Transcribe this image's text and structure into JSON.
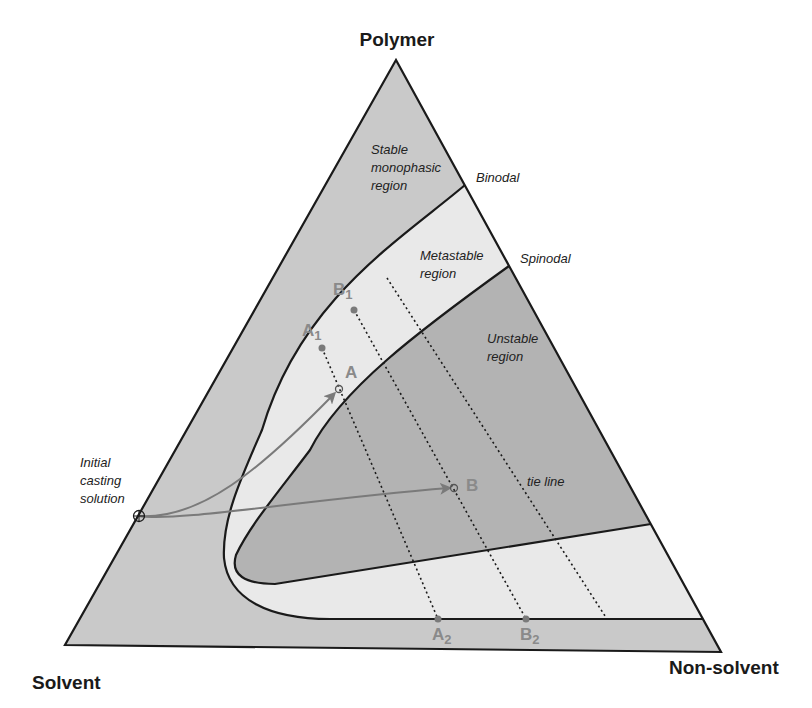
{
  "diagram": {
    "type": "ternary-phase-diagram",
    "vertices": {
      "top": "Polymer",
      "bottom_left": "Solvent",
      "bottom_right": "Non-solvent"
    },
    "curves": {
      "binodal": "Binodal",
      "spinodal": "Spinodal"
    },
    "regions": {
      "stable": [
        "Stable",
        "monophasic",
        "region"
      ],
      "metastable": [
        "Metastable",
        "region"
      ],
      "unstable": [
        "Unstable",
        "region"
      ]
    },
    "annotations": {
      "initial": [
        "Initial",
        "casting",
        "solution"
      ],
      "tie_line": "tie line"
    },
    "points": {
      "A": {
        "label": "A"
      },
      "B": {
        "label": "B"
      },
      "A1": {
        "label": "A",
        "sub": "1"
      },
      "B1": {
        "label": "B",
        "sub": "1"
      },
      "A2": {
        "label": "A",
        "sub": "2"
      },
      "B2": {
        "label": "B",
        "sub": "2"
      }
    },
    "colors": {
      "stable_fill": "#c9c9c9",
      "metastable_fill": "#e9e9e9",
      "unstable_fill": "#b3b3b3",
      "line": "#1a1a1a",
      "path_arrow": "#7a7a7a",
      "point_label": "#8a8a8a"
    }
  }
}
